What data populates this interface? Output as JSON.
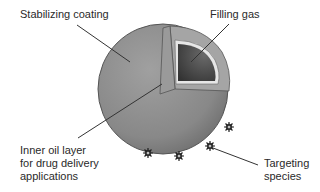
{
  "diagram": {
    "labels": {
      "stabilizing_coating": "Stabilizing coating",
      "filling_gas": "Filling gas",
      "inner_oil_line1": "Inner oil layer",
      "inner_oil_line2": "for drug delivery",
      "inner_oil_line3": "applications",
      "targeting_line1": "Targeting",
      "targeting_line2": "species"
    },
    "colors": {
      "sphere_outer": "#8a8a8a",
      "sphere_edge": "#555555",
      "cut_face": "#a8a8a8",
      "oil_layer": "#e8e8e8",
      "gas_core": "#4a4a4a",
      "leader_line": "#333333",
      "text": "#2a2a2a"
    },
    "targeting_species_count": 4
  }
}
